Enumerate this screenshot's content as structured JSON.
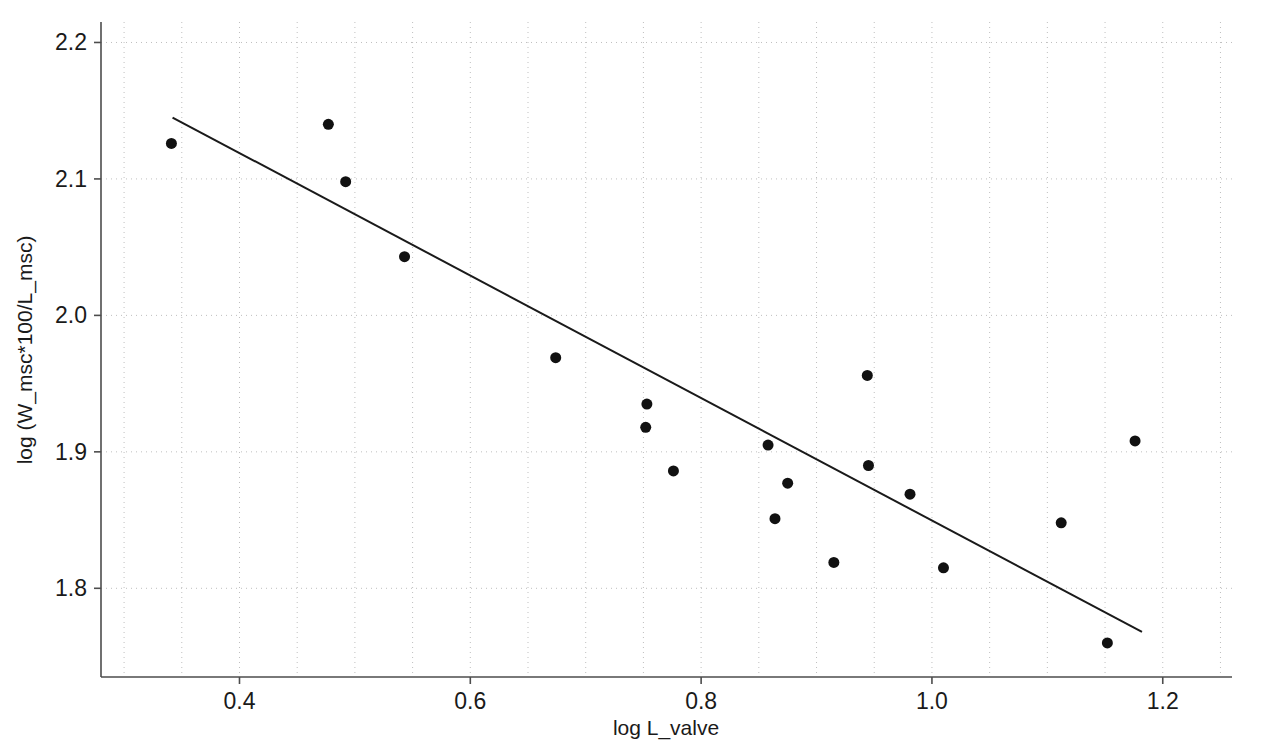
{
  "chart_data": {
    "type": "scatter",
    "title": "",
    "xlabel": "log L_valve",
    "ylabel": "log (W_msc*100/L_msc)",
    "xlim": [
      0.28,
      1.26
    ],
    "ylim": [
      1.735,
      2.215
    ],
    "xticks": [
      0.4,
      0.6,
      0.8,
      1.0,
      1.2
    ],
    "xtick_labels": [
      "0.4",
      "0.6",
      "0.8",
      "1.0",
      "1.2"
    ],
    "yticks": [
      1.8,
      1.9,
      2.0,
      2.1,
      2.2
    ],
    "ytick_labels": [
      "1.8",
      "1.9",
      "2.0",
      "2.1",
      "2.2"
    ],
    "grid": true,
    "grid_style": "dotted",
    "grid_color": "#bfbfbf",
    "legend": null,
    "marker": {
      "shape": "circle",
      "color": "#111111",
      "size_px": 11
    },
    "points": [
      {
        "x": 0.341,
        "y": 2.126
      },
      {
        "x": 0.477,
        "y": 2.14
      },
      {
        "x": 0.492,
        "y": 2.098
      },
      {
        "x": 0.543,
        "y": 2.043
      },
      {
        "x": 0.674,
        "y": 1.969
      },
      {
        "x": 0.753,
        "y": 1.935
      },
      {
        "x": 0.752,
        "y": 1.918
      },
      {
        "x": 0.776,
        "y": 1.886
      },
      {
        "x": 0.858,
        "y": 1.905
      },
      {
        "x": 0.864,
        "y": 1.851
      },
      {
        "x": 0.875,
        "y": 1.877
      },
      {
        "x": 0.915,
        "y": 1.819
      },
      {
        "x": 0.944,
        "y": 1.956
      },
      {
        "x": 0.945,
        "y": 1.89
      },
      {
        "x": 0.981,
        "y": 1.869
      },
      {
        "x": 1.01,
        "y": 1.815
      },
      {
        "x": 1.112,
        "y": 1.848
      },
      {
        "x": 1.152,
        "y": 1.76
      },
      {
        "x": 1.176,
        "y": 1.908
      }
    ],
    "trendline": {
      "type": "linear-fit",
      "color": "#1a1a1a",
      "x_start": 0.342,
      "y_start": 2.145,
      "x_end": 1.182,
      "y_end": 1.768
    }
  },
  "axes": {
    "spine_color": "#4d4d4d",
    "plot_left_px": 101,
    "plot_right_px": 1232,
    "plot_top_px": 22,
    "plot_bottom_px": 677
  }
}
